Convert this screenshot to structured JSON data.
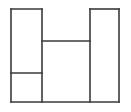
{
  "figure": {
    "canvas": {
      "width": 131,
      "height": 112,
      "background": "#ffffff"
    },
    "style": {
      "stroke_color": "#3a3a3a",
      "stroke_width": 1.6,
      "fill_color": "#ffffff"
    },
    "faces": [
      {
        "name": "upper-left-rectangle",
        "x": 11,
        "y": 9,
        "width": 31,
        "height": 64
      },
      {
        "name": "lower-left-rectangle",
        "x": 11,
        "y": 73,
        "width": 31,
        "height": 29
      },
      {
        "name": "middle-rectangle",
        "x": 42,
        "y": 41,
        "width": 48,
        "height": 61
      },
      {
        "name": "right-rectangle",
        "x": 90,
        "y": 9,
        "width": 29,
        "height": 93
      }
    ],
    "segments": [
      {
        "name": "left-column-top-edge",
        "orientation": "horizontal",
        "x1": 11,
        "y1": 9,
        "x2": 42,
        "y2": 9
      },
      {
        "name": "right-column-top-edge",
        "orientation": "horizontal",
        "x1": 90,
        "y1": 9,
        "x2": 119,
        "y2": 9
      },
      {
        "name": "middle-crossbar",
        "orientation": "horizontal",
        "x1": 42,
        "y1": 41,
        "x2": 90,
        "y2": 41
      },
      {
        "name": "left-column-divider",
        "orientation": "horizontal",
        "x1": 11,
        "y1": 73,
        "x2": 42,
        "y2": 73
      },
      {
        "name": "bottom-edge",
        "orientation": "horizontal",
        "x1": 11,
        "y1": 102,
        "x2": 119,
        "y2": 102
      },
      {
        "name": "left-outer-edge",
        "orientation": "vertical",
        "x1": 11,
        "y1": 9,
        "x2": 11,
        "y2": 102
      },
      {
        "name": "left-inner-edge",
        "orientation": "vertical",
        "x1": 42,
        "y1": 9,
        "x2": 42,
        "y2": 102
      },
      {
        "name": "right-inner-edge",
        "orientation": "vertical",
        "x1": 90,
        "y1": 9,
        "x2": 90,
        "y2": 102
      },
      {
        "name": "right-outer-edge",
        "orientation": "vertical",
        "x1": 119,
        "y1": 9,
        "x2": 119,
        "y2": 102
      }
    ]
  }
}
